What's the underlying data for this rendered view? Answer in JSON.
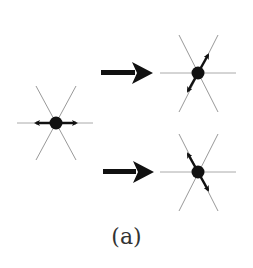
{
  "caption": "(a)",
  "colors": {
    "line": "#9a9a9a",
    "node": "#111111",
    "arrow": "#111111",
    "caption": "#333333"
  },
  "nodes": [
    {
      "id": "initial",
      "cx": 56,
      "cy": 123,
      "motion": "horizontal-both"
    },
    {
      "id": "result-top",
      "cx": 198,
      "cy": 73,
      "motion": "diagonal-ne-sw"
    },
    {
      "id": "result-bottom",
      "cx": 198,
      "cy": 172,
      "motion": "diagonal-nw-se"
    }
  ],
  "transitions": [
    {
      "from": "initial",
      "to": "result-top"
    },
    {
      "from": "initial",
      "to": "result-bottom"
    }
  ]
}
